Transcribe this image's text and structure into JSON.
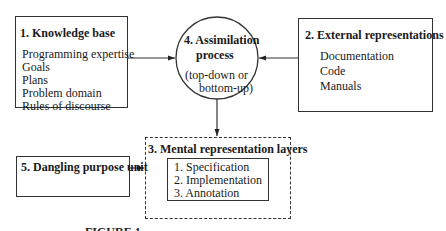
{
  "diagram": {
    "knowledge_base": {
      "title": "1. Knowledge base",
      "items": [
        "Programming expertise",
        "Goals",
        "Plans",
        "Problem domain",
        "Rules of discourse"
      ]
    },
    "external_representations": {
      "title": "2. External representations",
      "items": [
        "Documentation",
        "Code",
        "Manuals"
      ]
    },
    "mental_representation_layers": {
      "title": "3. Mental representation layers",
      "items": [
        "1. Specification",
        "2. Implementation",
        "3. Annotation"
      ]
    },
    "assimilation_process": {
      "title_line1": "4. Assimilation",
      "title_line2": "process",
      "sub_line1": "(top-down or",
      "sub_line2": "bottom-up)"
    },
    "dangling_purpose_unit": {
      "title": "5. Dangling purpose unit"
    },
    "caption": "FIGURE 1."
  }
}
